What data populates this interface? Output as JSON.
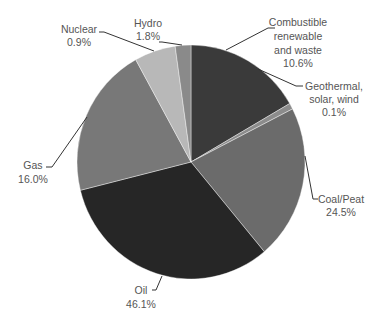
{
  "chart_data": {
    "type": "pie",
    "title": "",
    "legend": "none",
    "slices": [
      {
        "label": "Combustible renewable and waste",
        "label_lines": [
          "Combustible",
          "renewable",
          "and waste"
        ],
        "value": 10.6,
        "value_text": "10.6%",
        "color": "#3a3a3a",
        "start_deg": 0,
        "end_deg": 60
      },
      {
        "label": "Geothermal, solar, wind",
        "label_lines": [
          "Geothermal,",
          "solar, wind"
        ],
        "value": 0.1,
        "value_text": "0.1%",
        "color": "#8c8c8c",
        "start_deg": 60,
        "end_deg": 63
      },
      {
        "label": "Coal/Peat",
        "label_lines": [
          "Coal/Peat"
        ],
        "value": 24.5,
        "value_text": "24.5%",
        "color": "#6b6b6b",
        "start_deg": 63,
        "end_deg": 140
      },
      {
        "label": "Oil",
        "label_lines": [
          "Oil"
        ],
        "value": 46.1,
        "value_text": "46.1%",
        "color": "#262626",
        "start_deg": 140,
        "end_deg": 256
      },
      {
        "label": "Gas",
        "label_lines": [
          "Gas"
        ],
        "value": 16.0,
        "value_text": "16.0%",
        "color": "#787878",
        "start_deg": 256,
        "end_deg": 331
      },
      {
        "label": "Nuclear",
        "label_lines": [
          "Nuclear"
        ],
        "value": 0.9,
        "value_text": "0.9%",
        "color": "#b8b8b8",
        "start_deg": 331,
        "end_deg": 352
      },
      {
        "label": "Hydro",
        "label_lines": [
          "Hydro"
        ],
        "value": 1.8,
        "value_text": "1.8%",
        "color": "#8a8a8a",
        "start_deg": 352,
        "end_deg": 360
      }
    ]
  },
  "labels": {
    "combustible": {
      "l1": "Combustible",
      "l2": "renewable",
      "l3": "and waste",
      "pct": "10.6%"
    },
    "geothermal": {
      "l1": "Geothermal,",
      "l2": "solar, wind",
      "pct": "0.1%"
    },
    "coal": {
      "l1": "Coal/Peat",
      "pct": "24.5%"
    },
    "oil": {
      "l1": "Oil",
      "pct": "46.1%"
    },
    "gas": {
      "l1": "Gas",
      "pct": "16.0%"
    },
    "nuclear": {
      "l1": "Nuclear",
      "pct": "0.9%"
    },
    "hydro": {
      "l1": "Hydro",
      "pct": "1.8%"
    }
  }
}
